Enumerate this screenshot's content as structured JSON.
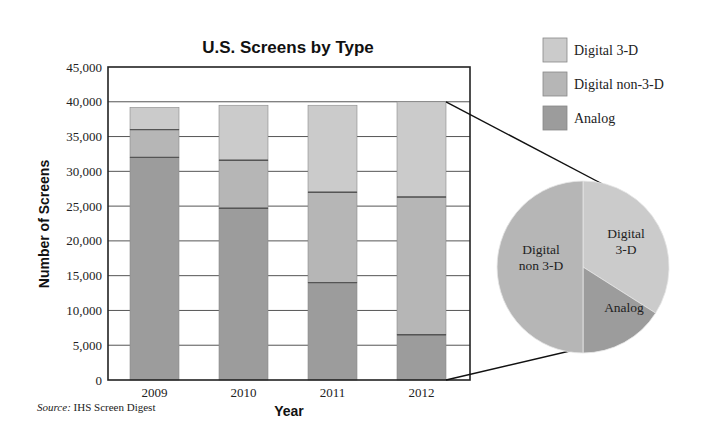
{
  "chart_data": {
    "type": "bar",
    "subtype": "stacked-bar-with-pie",
    "title": "U.S. Screens by Type",
    "xlabel": "Year",
    "ylabel": "Number of Screens",
    "ylim": [
      0,
      45000
    ],
    "yticks": [
      0,
      5000,
      10000,
      15000,
      20000,
      25000,
      30000,
      35000,
      40000,
      45000
    ],
    "ytick_labels": [
      "0",
      "5,000",
      "10,000",
      "15,000",
      "20,000",
      "25,000",
      "30,000",
      "35,000",
      "40,000",
      "45,000"
    ],
    "grid": true,
    "categories": [
      "2009",
      "2010",
      "2011",
      "2012"
    ],
    "series": [
      {
        "name": "Analog",
        "color": "#9c9c9c",
        "values": [
          32000,
          24700,
          14000,
          6500
        ]
      },
      {
        "name": "Digital non-3-D",
        "color": "#b6b6b6",
        "values": [
          4000,
          6900,
          13000,
          19800
        ]
      },
      {
        "name": "Digital 3-D",
        "color": "#cbcbcb",
        "values": [
          3200,
          7900,
          12500,
          13700
        ]
      }
    ],
    "legend": {
      "position": "top-right",
      "entries": [
        {
          "label": "Digital 3-D",
          "color": "#cbcbcb"
        },
        {
          "label": "Digital non-3-D",
          "color": "#b6b6b6"
        },
        {
          "label": "Analog",
          "color": "#9c9c9c"
        }
      ]
    },
    "pie": {
      "depicts": "2012",
      "slices": [
        {
          "label": "Digital 3-D",
          "display_label": [
            "Digital",
            "3-D"
          ],
          "value": 34,
          "color": "#cbcbcb"
        },
        {
          "label": "Analog",
          "display_label": [
            "Analog"
          ],
          "value": 16,
          "color": "#9c9c9c"
        },
        {
          "label": "Digital non 3-D",
          "display_label": [
            "Digital",
            "non 3-D"
          ],
          "value": 50,
          "color": "#b6b6b6"
        }
      ]
    }
  },
  "source": {
    "prefix": "Source:",
    "text": " IHS Screen Digest"
  }
}
